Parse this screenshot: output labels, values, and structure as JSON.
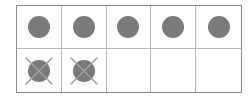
{
  "diagram": {
    "type": "ten-frame",
    "rows": 2,
    "columns": 5,
    "colors": {
      "border": "#8a8a8a",
      "divider": "#b5b5b5",
      "counter": "#7a7a7a",
      "cross": "#a0a0a0"
    },
    "cells": [
      {
        "state": "counter"
      },
      {
        "state": "counter"
      },
      {
        "state": "counter"
      },
      {
        "state": "counter"
      },
      {
        "state": "counter"
      },
      {
        "state": "crossed"
      },
      {
        "state": "crossed"
      },
      {
        "state": "empty"
      },
      {
        "state": "empty"
      },
      {
        "state": "empty"
      }
    ],
    "summary": {
      "total_cells": 10,
      "counters": 7,
      "crossed_out": 2,
      "remaining": 5,
      "empty": 3
    }
  }
}
